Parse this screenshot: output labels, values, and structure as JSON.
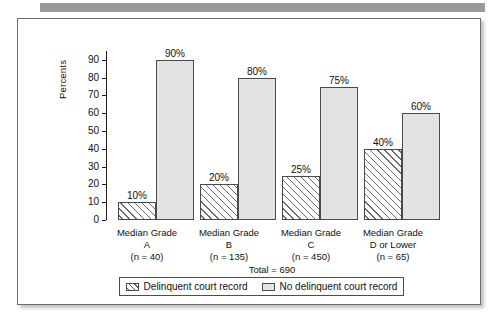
{
  "figure": {
    "y_axis_title": "Percents",
    "y_ticks": [
      "0",
      "10",
      "20",
      "30",
      "40",
      "50",
      "60",
      "70",
      "80",
      "90"
    ],
    "total_label": "Total = 690",
    "legend": [
      {
        "swatch": "hatched-swatch",
        "label": "Delinquent court record"
      },
      {
        "swatch": "solid-swatch",
        "label": "No delinquent court record"
      }
    ]
  },
  "chart_data": {
    "type": "bar",
    "title": "",
    "xlabel": "",
    "ylabel": "Percents",
    "ylim": [
      0,
      95
    ],
    "grid": false,
    "legend_position": "bottom",
    "categories": [
      "Median Grade A",
      "Median Grade B",
      "Median Grade C",
      "Median Grade D or Lower"
    ],
    "category_lines": [
      {
        "line1": "Median Grade",
        "line2": "A",
        "line3": "(n = 40)"
      },
      {
        "line1": "Median Grade",
        "line2": "B",
        "line3": "(n = 135)"
      },
      {
        "line1": "Median Grade",
        "line2": "C",
        "line3": "(n = 450)"
      },
      {
        "line1": "Median Grade",
        "line2": "D or Lower",
        "line3": "(n = 65)"
      }
    ],
    "group_sizes": [
      40,
      135,
      450,
      65
    ],
    "total": 690,
    "series": [
      {
        "name": "Delinquent court record",
        "values": [
          10,
          20,
          25,
          40
        ],
        "value_labels": [
          "10%",
          "20%",
          "25%",
          "40%"
        ],
        "fill": "hatched"
      },
      {
        "name": "No delinquent court record",
        "values": [
          90,
          80,
          75,
          60
        ],
        "value_labels": [
          "90%",
          "80%",
          "75%",
          "60%"
        ],
        "fill": "solid"
      }
    ]
  },
  "colors": {
    "bar_fill": "#e3e3e3",
    "bar_border": "#4a4a4a",
    "axis": "#1b1b1b",
    "frame": "#6d6d6d",
    "top_band": "#9a9a9a"
  }
}
